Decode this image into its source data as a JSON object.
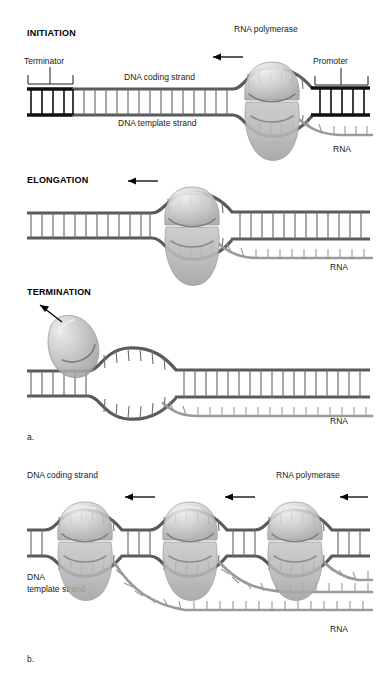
{
  "figure": {
    "panel_a_label": "a.",
    "panel_b_label": "b."
  },
  "panel_a": {
    "stages": [
      {
        "id": "initiation",
        "title": "INITIATION",
        "labels": {
          "terminator": "Terminator",
          "promoter": "Promoter",
          "polymerase": "RNA polymerase",
          "coding_strand": "DNA coding strand",
          "template_strand": "DNA template strand",
          "rna": "RNA"
        }
      },
      {
        "id": "elongation",
        "title": "ELONGATION",
        "labels": {
          "rna": "RNA"
        }
      },
      {
        "id": "termination",
        "title": "TERMINATION",
        "labels": {
          "rna": "RNA"
        }
      }
    ]
  },
  "panel_b": {
    "labels": {
      "coding_strand": "DNA coding strand",
      "polymerase": "RNA polymerase",
      "template_strand_line1": "DNA",
      "template_strand_line2": "template strand",
      "rna": "RNA"
    },
    "polymerase_count": 3
  },
  "colors": {
    "background": "#ffffff",
    "dna_rail": "#5a5a5a",
    "dna_terminator": "#101010",
    "dna_rung": "#6e6e6e",
    "rna": "#9a9a9a",
    "polymerase_fill": "#b9b9b9",
    "polymerase_highlight": "#dedede",
    "text": "#1a1a1a",
    "arrow": "#000000"
  }
}
